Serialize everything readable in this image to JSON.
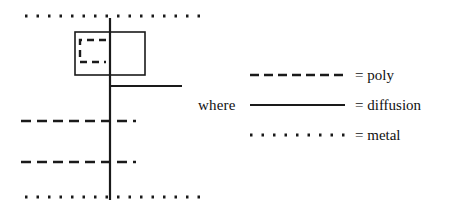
{
  "figure": {
    "title": "",
    "background_color": "#ffffff",
    "ink_color": "#1a1a1a"
  },
  "legend": {
    "where_label": "where",
    "entries": [
      {
        "id": "poly",
        "style": "dashed",
        "equals": "= poly"
      },
      {
        "id": "diffusion",
        "style": "solid",
        "equals": "= diffusion"
      },
      {
        "id": "metal",
        "style": "dotted",
        "equals": "= metal"
      }
    ]
  },
  "layout": {
    "description": "IC mask layout fragment",
    "shapes": [
      {
        "name": "metal-line-top",
        "style": "dotted",
        "orientation": "horizontal",
        "x1": 25,
        "y1": 16,
        "x2": 200,
        "y2": 16
      },
      {
        "name": "metal-line-bottom",
        "style": "dotted",
        "orientation": "horizontal",
        "x1": 25,
        "y1": 197,
        "x2": 200,
        "y2": 197
      },
      {
        "name": "poly-line-upper",
        "style": "dashed",
        "orientation": "horizontal",
        "x1": 21,
        "y1": 121,
        "x2": 136,
        "y2": 121
      },
      {
        "name": "poly-line-lower",
        "style": "dashed",
        "orientation": "horizontal",
        "x1": 21,
        "y1": 162,
        "x2": 136,
        "y2": 162
      },
      {
        "name": "diffusion-line-vertical",
        "style": "solid",
        "orientation": "vertical",
        "x1": 110,
        "y1": 18,
        "x2": 110,
        "y2": 200
      },
      {
        "name": "diffusion-line-stub",
        "style": "solid",
        "orientation": "horizontal",
        "x1": 110,
        "y1": 86,
        "x2": 182,
        "y2": 86
      }
    ],
    "contact_box": {
      "name": "contact-box",
      "style": "solid",
      "x": 75,
      "y": 32,
      "width": 70,
      "height": 43
    },
    "inner_poly_shape": {
      "name": "inner-poly-shape",
      "style": "dashed",
      "x": 80,
      "y": 40,
      "width": 26,
      "height": 22,
      "open_side": "right"
    }
  }
}
